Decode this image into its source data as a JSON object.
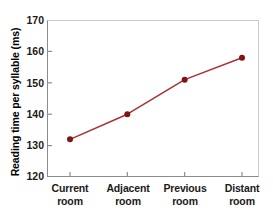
{
  "chart_data": {
    "type": "line",
    "title": "",
    "xlabel": "",
    "ylabel": "Reading time per syllable (ms)",
    "categories": [
      "Current room",
      "Adjacent room",
      "Previous room",
      "Distant room"
    ],
    "category_lines": [
      [
        "Current",
        "room"
      ],
      [
        "Adjacent",
        "room"
      ],
      [
        "Previous",
        "room"
      ],
      [
        "Distant",
        "room"
      ]
    ],
    "values": [
      132,
      140,
      151,
      158
    ],
    "ylim": [
      120,
      170
    ],
    "yticks": [
      120,
      130,
      140,
      150,
      160,
      170
    ],
    "ytick_labels": [
      "120",
      "130",
      "140",
      "150",
      "160",
      "170"
    ],
    "grid": false,
    "legend": false,
    "series": [
      {
        "name": "Reading time per syllable",
        "values": [
          132,
          140,
          151,
          158
        ]
      }
    ]
  },
  "style": {
    "line_color": "#a83232",
    "marker_color": "#7e1414",
    "axis_color": "#8c8c8c",
    "text_color": "#1a1a1a",
    "background": "#ffffff"
  }
}
